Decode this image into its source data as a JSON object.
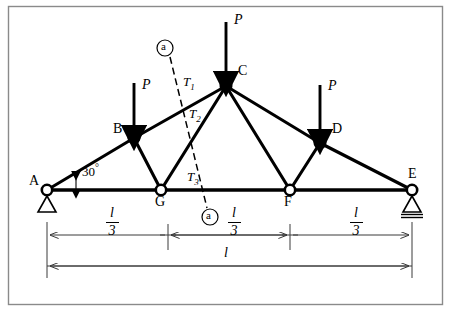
{
  "figure": {
    "type": "truss-diagram",
    "border": {
      "x": 8,
      "y": 6,
      "w": 435,
      "h": 299
    },
    "nodes": [
      {
        "id": "A",
        "label": "A",
        "x": 47,
        "y": 190,
        "label_x": 29,
        "label_y": 176
      },
      {
        "id": "B",
        "label": "B",
        "x": 134,
        "y": 138,
        "label_x": 114,
        "label_y": 124
      },
      {
        "id": "C",
        "label": "C",
        "x": 226,
        "y": 86,
        "label_x": 238,
        "label_y": 66
      },
      {
        "id": "D",
        "label": "D",
        "x": 320,
        "y": 143,
        "label_x": 333,
        "label_y": 124
      },
      {
        "id": "E",
        "label": "E",
        "x": 412,
        "y": 190,
        "label_x": 409,
        "label_y": 169
      },
      {
        "id": "G",
        "label": "G",
        "x": 161,
        "y": 190,
        "label_x": 155,
        "label_y": 197
      },
      {
        "id": "F",
        "label": "F",
        "x": 290,
        "y": 190,
        "label_x": 285,
        "label_y": 197
      }
    ],
    "members": [
      {
        "from": "A",
        "to": "B"
      },
      {
        "from": "B",
        "to": "C"
      },
      {
        "from": "C",
        "to": "D"
      },
      {
        "from": "D",
        "to": "E"
      },
      {
        "from": "A",
        "to": "G"
      },
      {
        "from": "G",
        "to": "F"
      },
      {
        "from": "F",
        "to": "E"
      },
      {
        "from": "B",
        "to": "G"
      },
      {
        "from": "G",
        "to": "C"
      },
      {
        "from": "C",
        "to": "F"
      },
      {
        "from": "F",
        "to": "D"
      }
    ],
    "loads": [
      {
        "label": "P",
        "at": "B",
        "x": 134,
        "y_start": 83,
        "y_end": 133,
        "label_x": 142,
        "label_y": 80
      },
      {
        "label": "P",
        "at": "C",
        "x": 226,
        "y_start": 22,
        "y_end": 80,
        "label_x": 234,
        "label_y": 15
      },
      {
        "label": "P",
        "at": "D",
        "x": 320,
        "y_start": 85,
        "y_end": 137,
        "label_x": 328,
        "label_y": 81
      }
    ],
    "section_line": {
      "label": "a",
      "x1": 170,
      "y1": 57,
      "x2": 207,
      "y2": 208,
      "marker_top": {
        "cx": 165,
        "cy": 48,
        "r": 8
      },
      "marker_bottom": {
        "cx": 210,
        "cy": 217,
        "r": 8
      }
    },
    "force_labels": [
      {
        "base": "T",
        "sub": "1",
        "x": 184,
        "y": 76
      },
      {
        "base": "T",
        "sub": "2",
        "x": 190,
        "y": 108
      },
      {
        "base": "T",
        "sub": "3",
        "x": 188,
        "y": 171
      }
    ],
    "angle": {
      "label": "30",
      "unit": "°",
      "x": 81,
      "y": 165,
      "vertex_x": 47,
      "vertex_y": 190
    },
    "supports": [
      {
        "type": "pin",
        "at": "A",
        "x": 47,
        "y": 190
      },
      {
        "type": "roller",
        "at": "E",
        "x": 412,
        "y": 190
      }
    ],
    "dimensions": {
      "segment_label": {
        "numerator": "l",
        "denominator": "3"
      },
      "total_label": "l",
      "upper_line_y": 235,
      "lower_line_y": 266,
      "ticks_x": [
        47,
        168,
        290,
        412
      ],
      "segments": [
        {
          "x1": 47,
          "x2": 168,
          "label_cx": 107
        },
        {
          "x1": 168,
          "x2": 290,
          "label_cx": 229
        },
        {
          "x1": 290,
          "x2": 412,
          "label_cx": 351
        }
      ],
      "total": {
        "x1": 47,
        "x2": 412,
        "label_cx": 226,
        "label_y": 248
      }
    },
    "colors": {
      "stroke": "#000000",
      "background": "#ffffff",
      "border": "#8a8a8a",
      "dimension": "#3a3a3a"
    }
  }
}
